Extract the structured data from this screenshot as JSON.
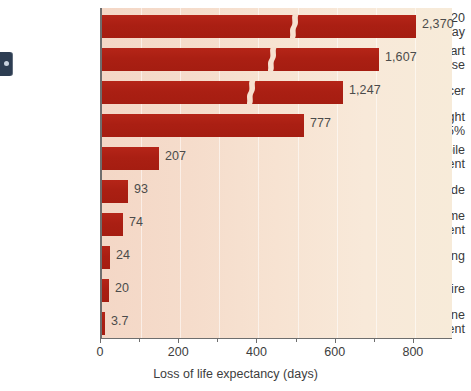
{
  "chart_data": {
    "type": "bar",
    "orientation": "horizontal",
    "title": "",
    "xlabel": "Loss of life expectancy (days)",
    "ylabel": "",
    "xlim": [
      0,
      900
    ],
    "xticks": [
      0,
      200,
      400,
      600,
      800
    ],
    "xtick_labels": [
      "0",
      "200",
      "400",
      "600",
      "800"
    ],
    "minor_ticks": [
      100,
      300,
      500,
      700
    ],
    "grid": true,
    "legend": "none",
    "axis_break_note": "Top three bars are truncated with a squiggle break mark; their true values exceed the axis range.",
    "categories": [
      "Smoking 20\ncigarettes a day",
      "Heart\ndisease",
      "Cancer",
      "Overweight\nby 15%",
      "Automobile\naccident",
      "Homicide",
      "Home\naccident",
      "Drowning",
      "Fire",
      "Airplane\naccident"
    ],
    "values": [
      2370,
      1607,
      1247,
      777,
      207,
      93,
      74,
      24,
      20,
      3.7
    ],
    "value_labels": [
      "2,370",
      "1,607",
      "1,247",
      "777",
      "207",
      "93",
      "74",
      "24",
      "20",
      "3.7"
    ],
    "broken": [
      true,
      true,
      true,
      false,
      false,
      false,
      false,
      false,
      false,
      false
    ],
    "bar_pixel_widths": [
      314,
      277,
      241,
      202,
      57,
      26,
      21,
      8,
      7,
      3
    ],
    "colors": {
      "bar": "#ae2014",
      "plot_background_left": "#f4d7c6",
      "plot_background_right": "#f7ebd9",
      "gridline": "#ffffff",
      "axis": "#6e6e6e",
      "text": "#3a3a3a",
      "edge_tab": "#2d3d52"
    }
  },
  "edge_tab": {
    "name": "page-marker"
  }
}
